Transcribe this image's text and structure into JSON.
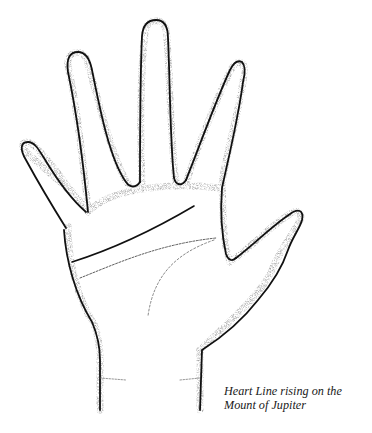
{
  "figure": {
    "caption": {
      "line1": "Heart Line rising on the",
      "line2": "Mount of Jupiter"
    },
    "colors": {
      "outline": "#111111",
      "stipple": "#555555",
      "background": "#ffffff"
    }
  }
}
